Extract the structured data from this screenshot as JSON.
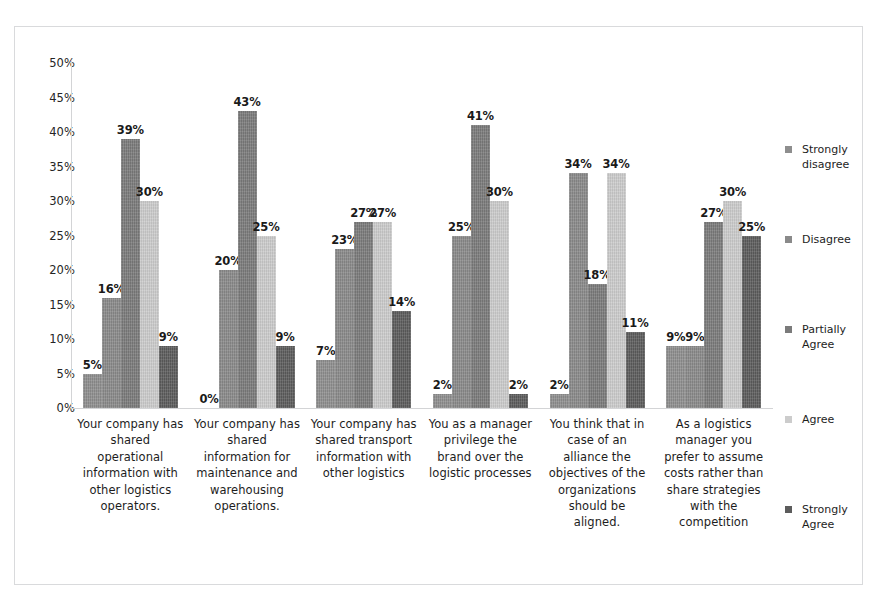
{
  "chart_data": {
    "type": "bar",
    "title": "",
    "subtitle": "",
    "xlabel": "",
    "ylabel": "",
    "ylim": [
      0,
      50
    ],
    "ytick_step": 5,
    "ytick_labels": [
      "50%",
      "45%",
      "40%",
      "35%",
      "30%",
      "25%",
      "20%",
      "15%",
      "10%",
      "5%",
      "0%"
    ],
    "grid": false,
    "legend_position": "right",
    "value_labels": true,
    "orientation": "vertical",
    "grouping": "clustered",
    "categories": [
      "Your company has shared operational information with other logistics operators.",
      "Your company has shared information for maintenance and warehousing operations.",
      "Your company has shared transport information with other logistics",
      "You as a manager privilege the brand over the logistic processes",
      "You think that in case of an alliance the objectives of the organizations should be aligned.",
      "As a logistics manager you prefer to assume costs rather than share strategies with the competition"
    ],
    "series": [
      {
        "name": "Strongly disagree",
        "color": "#8e8e8e",
        "values": [
          5,
          0,
          7,
          2,
          2,
          9
        ],
        "labels": [
          "5%",
          "0%",
          "7%",
          "2%",
          "2%",
          "9%"
        ]
      },
      {
        "name": "Disagree",
        "color": "#8a8a8a",
        "values": [
          16,
          20,
          23,
          25,
          34,
          9
        ],
        "labels": [
          "16%",
          "20%",
          "23%",
          "25%",
          "34%",
          "9%"
        ]
      },
      {
        "name": "Partially Agree",
        "color": "#7b7b7b",
        "values": [
          39,
          43,
          27,
          41,
          18,
          27
        ],
        "labels": [
          "39%",
          "43%",
          "27%",
          "41%",
          "18%",
          "27%"
        ]
      },
      {
        "name": "Agree",
        "color": "#cccccc",
        "values": [
          30,
          25,
          27,
          30,
          34,
          30
        ],
        "labels": [
          "30%",
          "25%",
          "27%",
          "30%",
          "34%",
          "30%"
        ]
      },
      {
        "name": "Strongly Agree",
        "color": "#5c5c5c",
        "values": [
          9,
          9,
          14,
          2,
          11,
          25
        ],
        "labels": [
          "9%",
          "9%",
          "14%",
          "2%",
          "11%",
          "25%"
        ]
      }
    ]
  },
  "legend": {
    "items": [
      {
        "label": "Strongly\ndisagree",
        "color": "#8e8e8e",
        "top": 80
      },
      {
        "label": "Disagree",
        "color": "#8a8a8a",
        "top": 170
      },
      {
        "label": "Partially\nAgree",
        "color": "#7b7b7b",
        "top": 260
      },
      {
        "label": "Agree",
        "color": "#cccccc",
        "top": 350
      },
      {
        "label": "Strongly\nAgree",
        "color": "#5c5c5c",
        "top": 440
      }
    ]
  }
}
